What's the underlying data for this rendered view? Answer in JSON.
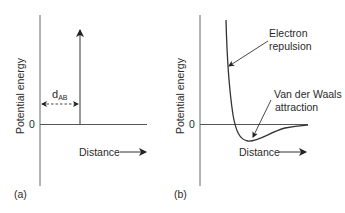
{
  "panels": [
    {
      "id": "a",
      "label": "(a)",
      "ylabel": "Potential energy",
      "zero_label": "0",
      "xlabel": "Distance",
      "distance_marker": {
        "main": "d",
        "sub": "AB"
      }
    },
    {
      "id": "b",
      "label": "(b)",
      "ylabel": "Potential energy",
      "zero_label": "0",
      "xlabel": "Distance",
      "annotations": {
        "repulsion_line1": "Electron",
        "repulsion_line2": "repulsion",
        "attraction_line1": "Van der Waals",
        "attraction_line2": "attraction"
      }
    }
  ],
  "colors": {
    "line": "#555555",
    "text": "#2a2a2a",
    "arrow": "#222222"
  }
}
